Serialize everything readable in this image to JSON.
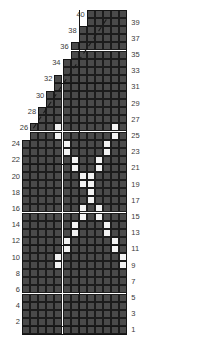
{
  "chart_data": {
    "type": "heatmap",
    "title": "",
    "xlabel": "",
    "ylabel": "",
    "columns": 13,
    "rows": 40,
    "cell_size": 8.1,
    "grid_left": 22,
    "grid_top": 10,
    "colors": {
      "filled": "#4a4a4a",
      "white": "#f2f2f2",
      "gridline": "#1c1c1c",
      "heavy_line": "#151515",
      "label": "#3a3a3a",
      "background": "#ffffff"
    },
    "left_labels": [
      40,
      38,
      36,
      34,
      32,
      30,
      28,
      26,
      24,
      22,
      20,
      18,
      16,
      14,
      12,
      10,
      8,
      6,
      4,
      2
    ],
    "right_labels": [
      39,
      37,
      35,
      33,
      31,
      29,
      27,
      25,
      23,
      21,
      19,
      17,
      15,
      13,
      11,
      9,
      7,
      5,
      3,
      1
    ],
    "row_start_column": [
      8,
      8,
      7,
      7,
      6,
      6,
      5,
      5,
      4,
      4,
      3,
      3,
      2,
      2,
      1,
      1,
      0,
      0,
      0,
      0,
      0,
      0,
      0,
      0,
      0,
      0,
      0,
      0,
      0,
      0,
      0,
      0,
      0,
      0,
      0,
      0,
      0,
      0,
      0,
      0
    ],
    "white_cells": [
      {
        "row": 26,
        "col": 4
      },
      {
        "row": 25,
        "col": 4
      },
      {
        "row": 26,
        "col": 11
      },
      {
        "row": 25,
        "col": 11
      },
      {
        "row": 24,
        "col": 5
      },
      {
        "row": 23,
        "col": 5
      },
      {
        "row": 24,
        "col": 10
      },
      {
        "row": 23,
        "col": 10
      },
      {
        "row": 22,
        "col": 6
      },
      {
        "row": 21,
        "col": 6
      },
      {
        "row": 22,
        "col": 9
      },
      {
        "row": 21,
        "col": 9
      },
      {
        "row": 20,
        "col": 7
      },
      {
        "row": 19,
        "col": 7
      },
      {
        "row": 20,
        "col": 8
      },
      {
        "row": 19,
        "col": 8
      },
      {
        "row": 18,
        "col": 8
      },
      {
        "row": 17,
        "col": 8
      },
      {
        "row": 16,
        "col": 7
      },
      {
        "row": 15,
        "col": 7
      },
      {
        "row": 16,
        "col": 9
      },
      {
        "row": 15,
        "col": 9
      },
      {
        "row": 14,
        "col": 6
      },
      {
        "row": 13,
        "col": 6
      },
      {
        "row": 14,
        "col": 10
      },
      {
        "row": 13,
        "col": 10
      },
      {
        "row": 12,
        "col": 5
      },
      {
        "row": 11,
        "col": 5
      },
      {
        "row": 12,
        "col": 11
      },
      {
        "row": 11,
        "col": 11
      },
      {
        "row": 10,
        "col": 4
      },
      {
        "row": 9,
        "col": 4
      },
      {
        "row": 10,
        "col": 12
      },
      {
        "row": 9,
        "col": 12
      }
    ],
    "heavy_rows": [
      1,
      11,
      21,
      31
    ],
    "heavy_center_column": 7,
    "diagonal_line": {
      "style": "dashed",
      "from_row": 26,
      "to_row": 40
    }
  }
}
